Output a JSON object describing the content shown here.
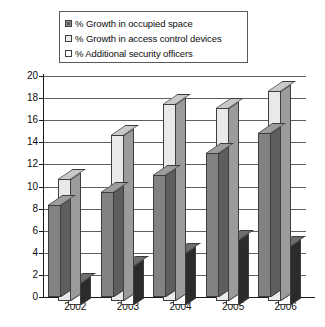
{
  "chart_data": {
    "type": "bar",
    "title": "",
    "subtitle": "",
    "xlabel": "",
    "ylabel": "",
    "categories": [
      "2002",
      "2003",
      "2004",
      "2005",
      "2006"
    ],
    "ylim": [
      0,
      20
    ],
    "y_ticks": [
      0,
      2,
      4,
      6,
      8,
      10,
      12,
      14,
      16,
      18,
      20
    ],
    "grid": true,
    "grid_axis": "y",
    "legend_position": "top-center",
    "style": "3d-clustered-column",
    "series": [
      {
        "name": "% Growth in occupied space",
        "color": "#828282",
        "swatch": "dark",
        "values": [
          8.3,
          9.5,
          11.0,
          13.0,
          14.8
        ]
      },
      {
        "name": "% Growth in access control devices",
        "color": "#e9e9e9",
        "swatch": "light",
        "values": [
          11.0,
          15.0,
          17.8,
          17.5,
          19.0
        ]
      },
      {
        "name": "% Additional security officers",
        "color": "#fdfdfd",
        "swatch": "white",
        "values": [
          2.0,
          3.5,
          4.7,
          5.9,
          5.3
        ]
      }
    ]
  },
  "legend": {
    "items": [
      {
        "label": "% Growth in occupied space",
        "swatch": "dark"
      },
      {
        "label": "% Growth in access control devices",
        "swatch": "light"
      },
      {
        "label": "% Additional security officers",
        "swatch": "white"
      }
    ]
  },
  "axes": {
    "y_tick_labels": [
      "20",
      "18",
      "16",
      "14",
      "12",
      "10",
      "8",
      "6",
      "4",
      "2",
      "0"
    ],
    "x_tick_labels": [
      "2002",
      "2003",
      "2004",
      "2005",
      "2006"
    ]
  },
  "colors": {
    "axis": "#1a1a1a",
    "gridline": "#5f5f5f",
    "border": "#3d3d3d",
    "background": "#ffffff",
    "series_dark": "#828282",
    "series_light": "#e9e9e9",
    "series_white": "#fdfdfd"
  }
}
